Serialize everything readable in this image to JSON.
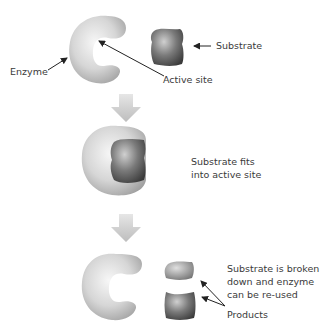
{
  "stage1": {
    "labels": {
      "enzyme": "Enzyme",
      "active_site": "Active site",
      "substrate": "Substrate"
    }
  },
  "stage2": {
    "caption_line1": "Substrate fits",
    "caption_line2": "into active site"
  },
  "stage3": {
    "caption_line1": "Substrate is broken",
    "caption_line2": "down and enzyme",
    "caption_line3": "can be re-used",
    "products_label": "Products"
  },
  "colors": {
    "enzyme_light": "#f2f2f2",
    "enzyme_mid": "#c8c8c8",
    "enzyme_dark": "#9a9a9a",
    "substrate_light": "#bdbdbd",
    "substrate_dark": "#4a4a4a",
    "arrow_fill": "#c4c4c4",
    "pointer": "#222222"
  }
}
